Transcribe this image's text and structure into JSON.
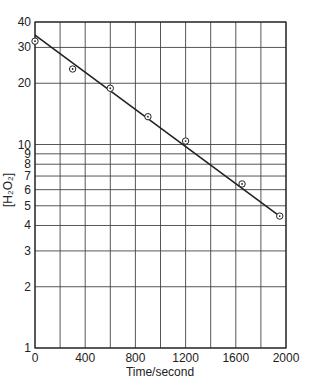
{
  "chart_data": {
    "type": "scatter",
    "title": "",
    "xlabel": "Time/second",
    "ylabel": "[H₂O₂]",
    "xlim": [
      0,
      2000
    ],
    "ylim": [
      1,
      40
    ],
    "yscale": "log",
    "grid": true,
    "x_ticks": [
      0,
      400,
      800,
      1200,
      1600,
      2000
    ],
    "x_tick_labels": [
      "0",
      "400",
      "800",
      "1200",
      "1600",
      "2000"
    ],
    "x_minor_gridlines": [
      200,
      600,
      1000,
      1400,
      1800
    ],
    "y_ticks": [
      1,
      2,
      3,
      4,
      5,
      6,
      7,
      8,
      9,
      10,
      20,
      30,
      40
    ],
    "y_tick_labels": [
      "1",
      "2",
      "3",
      "4",
      "5",
      "6",
      "7",
      "8",
      "9",
      "10",
      "20",
      "30",
      "40"
    ],
    "series": [
      {
        "name": "measured",
        "marker": "circled-dot",
        "x": [
          0,
          300,
          600,
          900,
          1200,
          1650,
          1950
        ],
        "y": [
          32.2,
          23.5,
          18.9,
          13.7,
          10.4,
          6.4,
          4.45
        ]
      },
      {
        "name": "fit",
        "type": "line",
        "x": [
          0,
          1960
        ],
        "y": [
          34.5,
          4.4
        ]
      }
    ],
    "legend": null
  },
  "colors": {
    "ink": "#222222",
    "grid": "#444444",
    "background": "#ffffff"
  }
}
